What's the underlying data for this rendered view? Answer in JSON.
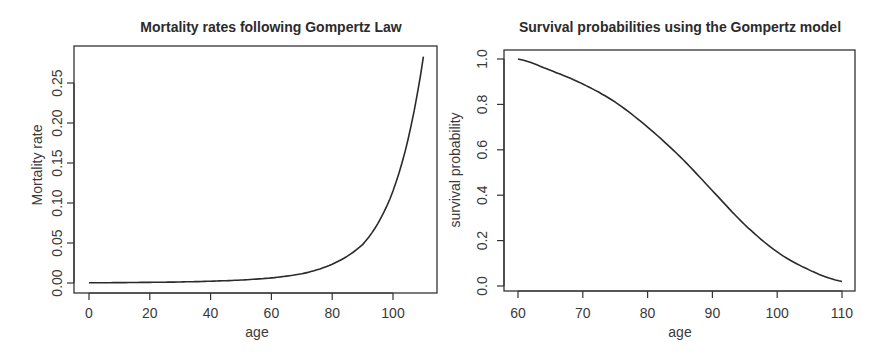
{
  "chart_data": [
    {
      "type": "line",
      "title": "Mortality rates following Gompertz Law",
      "xlabel": "age",
      "ylabel": "Mortality rate",
      "xlim": [
        0,
        110
      ],
      "ylim": [
        0,
        0.28
      ],
      "x_ticks": [
        "0",
        "20",
        "40",
        "60",
        "80",
        "100"
      ],
      "y_ticks": [
        "0.00",
        "0.05",
        "0.10",
        "0.15",
        "0.20",
        "0.25"
      ],
      "grid": false,
      "legend": null,
      "series": [
        {
          "name": "mortality",
          "x": [
            0,
            10,
            20,
            30,
            40,
            50,
            60,
            70,
            80,
            90,
            100,
            110
          ],
          "y": [
            0.0003,
            0.0005,
            0.0008,
            0.0013,
            0.0022,
            0.0037,
            0.0064,
            0.0115,
            0.0235,
            0.048,
            0.115,
            0.283
          ]
        }
      ]
    },
    {
      "type": "line",
      "title": "Survival probabilities using the Gompertz model",
      "xlabel": "age",
      "ylabel": "survival probability",
      "xlim": [
        60,
        110
      ],
      "ylim": [
        0,
        1
      ],
      "x_ticks": [
        "60",
        "70",
        "80",
        "90",
        "100",
        "110"
      ],
      "y_ticks": [
        "0.0",
        "0.2",
        "0.4",
        "0.6",
        "0.8",
        "1.0"
      ],
      "grid": false,
      "legend": null,
      "series": [
        {
          "name": "survival",
          "x": [
            60,
            65,
            70,
            75,
            80,
            85,
            90,
            95,
            100,
            105,
            110
          ],
          "y": [
            1.0,
            0.95,
            0.89,
            0.81,
            0.7,
            0.57,
            0.42,
            0.27,
            0.15,
            0.07,
            0.02
          ]
        }
      ]
    }
  ]
}
